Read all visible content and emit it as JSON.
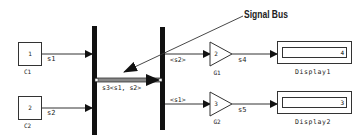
{
  "annotation": {
    "label": "Signal Bus"
  },
  "blocks": {
    "c1": {
      "value": "1",
      "name": "C1"
    },
    "c2": {
      "value": "2",
      "name": "C2"
    },
    "g1": {
      "value": "2",
      "name": "G1"
    },
    "g2": {
      "value": "3",
      "name": "G2"
    },
    "display1": {
      "value": "4",
      "name": "Display1"
    },
    "display2": {
      "value": "3",
      "name": "Display2"
    }
  },
  "signals": {
    "s1": "s1",
    "s2": "s2",
    "s3": "s3<s1, s2>",
    "s2_sel": "<s2>",
    "s1_sel": "<s1>",
    "s4": "s4",
    "s5": "s5"
  },
  "colors": {
    "line": "#333333",
    "bar": "#111111",
    "bus": "#666666"
  }
}
